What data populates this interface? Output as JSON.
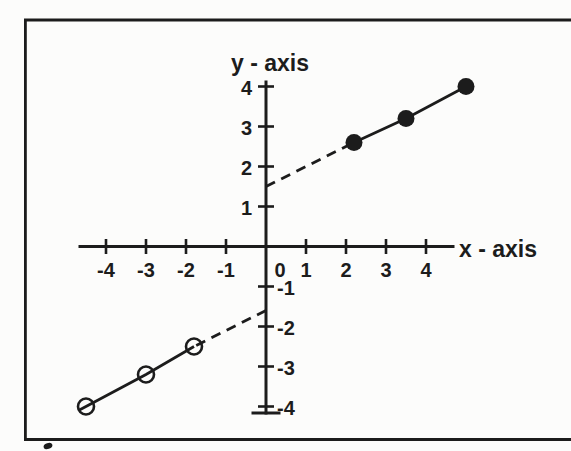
{
  "chart_data": {
    "type": "scatter",
    "xlabel": "x - axis",
    "ylabel": "y - axis",
    "xlim": [
      -4.65,
      4.7
    ],
    "ylim": [
      -4.2,
      4.1
    ],
    "x_tick_values": [
      -4,
      -3,
      -2,
      -1,
      0,
      1,
      2,
      3,
      4
    ],
    "y_tick_values": [
      -4,
      -3,
      -2,
      -1,
      1,
      2,
      3,
      4
    ],
    "grid": false,
    "series": [
      {
        "name": "positive-branch",
        "marker": "filled-circle",
        "line": "solid",
        "points": [
          [
            2.2,
            2.6
          ],
          [
            3.5,
            3.2
          ],
          [
            5.0,
            4.0
          ]
        ],
        "dashed_segment_to_y_axis": [
          0,
          1.5
        ]
      },
      {
        "name": "negative-branch",
        "marker": "open-circle",
        "line": "solid",
        "points": [
          [
            -4.5,
            -4.0
          ],
          [
            -3.0,
            -3.2
          ],
          [
            -1.8,
            -2.5
          ]
        ],
        "dashed_segment_to_y_axis": [
          0,
          -1.6
        ]
      }
    ]
  },
  "colors": {
    "ink": "#1c1c1c",
    "paper": "#fcfcfb"
  }
}
